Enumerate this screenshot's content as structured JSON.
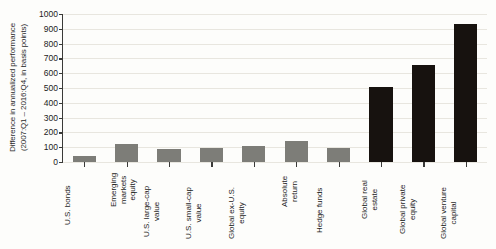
{
  "chart_data": {
    "type": "bar",
    "title": "",
    "subtitle": "",
    "xlabel": "",
    "ylabel_line1": "Difference in annualized performance",
    "ylabel_line2": "(2007:Q1 – 2016:Q4, in basis points)",
    "ylim": [
      0,
      1000
    ],
    "ytick_step": 100,
    "ytick_labels": [
      "1000",
      "900",
      "800",
      "700",
      "600",
      "500",
      "400",
      "300",
      "200",
      "100",
      "0"
    ],
    "grid": true,
    "legend": "none",
    "categories": [
      "U.S. bonds",
      "Emerging markets equity",
      "U.S. large-cap value",
      "U.S. small-cap value",
      "Global ex-U.S. equity",
      "Absolute return",
      "Hedge funds",
      "Global real estate",
      "Global private equity",
      "Global venture capital"
    ],
    "category_label_lines": [
      [
        "U.S. bonds"
      ],
      [
        "Emerging",
        "markets",
        "equity"
      ],
      [
        "U.S. large-cap",
        "value"
      ],
      [
        "U.S. small-cap",
        "value"
      ],
      [
        "Global ex-U.S.",
        "equity"
      ],
      [
        "Absolute",
        "return"
      ],
      [
        "Hedge funds"
      ],
      [
        "Global real",
        "estate"
      ],
      [
        "Global private",
        "equity"
      ],
      [
        "Global venture",
        "capital"
      ]
    ],
    "values": [
      40,
      120,
      85,
      95,
      105,
      145,
      95,
      505,
      655,
      935
    ],
    "bar_colors": [
      "#7d7d78",
      "#7d7d78",
      "#7d7d78",
      "#7d7d78",
      "#7d7d78",
      "#7d7d78",
      "#7d7d78",
      "#17120f",
      "#17120f",
      "#17120f"
    ]
  },
  "colors": {
    "gray_series": "#7d7d78",
    "black_series": "#17120f",
    "gridline": "#e8e6df",
    "axis": "#3a3a38",
    "background": "#fdfdfb",
    "text": "#1c1c1c"
  }
}
